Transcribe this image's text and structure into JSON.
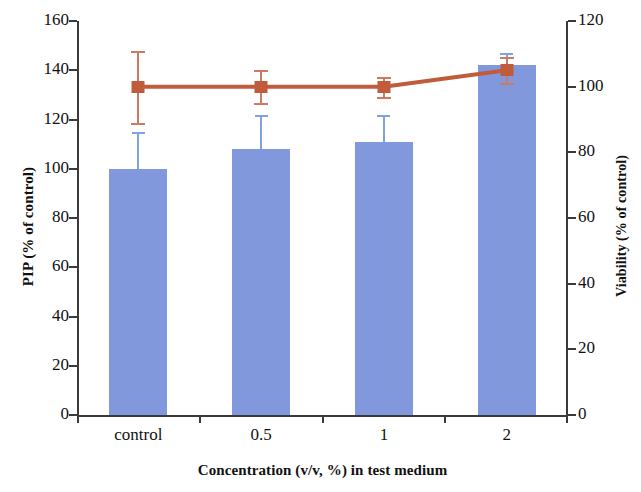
{
  "chart_data": {
    "type": "bar",
    "title": "",
    "xlabel": "Concentration (v/v, %) in test medium",
    "categories": [
      "control",
      "0.5",
      "1",
      "2"
    ],
    "grid": false,
    "legend": "none",
    "axes": {
      "left": {
        "label": "PIP (% of control)",
        "min": 0,
        "max": 160,
        "ticks": [
          0,
          20,
          40,
          60,
          80,
          100,
          120,
          140,
          160
        ],
        "tick_labels": [
          "0",
          "20",
          "40",
          "60",
          "80",
          "100",
          "120",
          "140",
          "160"
        ]
      },
      "right": {
        "label": "Viability (% of control)",
        "min": 0,
        "max": 120,
        "ticks": [
          0,
          20,
          40,
          60,
          80,
          100,
          120
        ],
        "tick_labels": [
          "0",
          "20",
          "40",
          "60",
          "80",
          "100",
          "120"
        ]
      }
    },
    "series": [
      {
        "name": "PIP (% of control)",
        "type": "bar",
        "axis": "left",
        "color": "#8298dd",
        "values": [
          100,
          108,
          111,
          142
        ],
        "errors": [
          15,
          14,
          11,
          5
        ]
      },
      {
        "name": "Viability (% of control)",
        "type": "line",
        "axis": "right",
        "color": "#c05c3c",
        "marker": "square",
        "values": [
          100,
          100,
          100,
          105
        ],
        "errors": [
          11,
          5,
          3,
          4
        ]
      }
    ]
  }
}
